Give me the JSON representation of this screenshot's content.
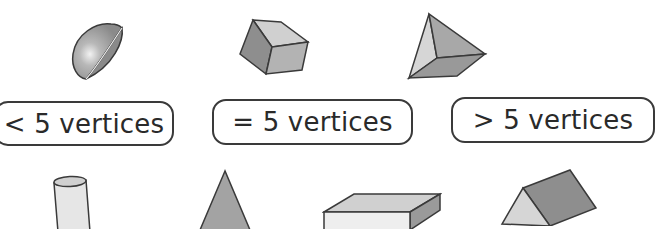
{
  "worksheet": {
    "topic": "Sort 3D shapes by number of vertices",
    "categories": [
      {
        "id": "lt5",
        "label": "< 5 vertices"
      },
      {
        "id": "eq5",
        "label": "= 5 vertices"
      },
      {
        "id": "gt5",
        "label": "> 5 vertices"
      }
    ],
    "shapes_top_row": [
      {
        "name": "hemisphere"
      },
      {
        "name": "cube"
      },
      {
        "name": "triangular-pyramid"
      }
    ],
    "shapes_bottom_row": [
      {
        "name": "cylinder"
      },
      {
        "name": "cone"
      },
      {
        "name": "rectangular-prism"
      },
      {
        "name": "triangular-prism"
      }
    ],
    "colors": {
      "outline": "#3a3a3a",
      "light_face": "#d9d9d9",
      "mid_face": "#b3b3b3",
      "dark_face": "#8e8e8e",
      "text": "#2a2a2a"
    }
  }
}
